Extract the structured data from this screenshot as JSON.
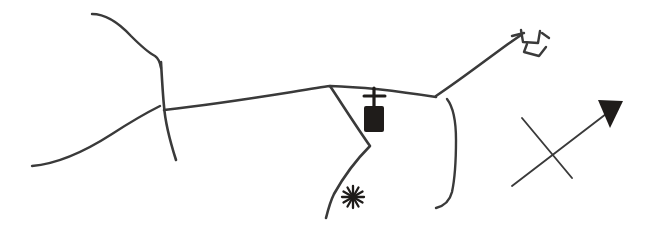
{
  "document": {
    "kind": "hand-drawn sketch map",
    "title": "",
    "background_color": "#ffffff",
    "ink_color": "#3a3a3a",
    "fill_color": "#1f1c1a",
    "width": 647,
    "height": 237
  },
  "map": {
    "roads": [
      {
        "id": "road-north-west-branch",
        "name": "north-west road branch",
        "stroke_width": 2.4,
        "path": "M 92 14 C 104 14, 118 22, 131 36 C 140 45, 147 52, 155 56 C 158 58, 160 62, 161 68"
      },
      {
        "id": "road-vertical-centre-left",
        "name": "centre-left vertical road",
        "stroke_width": 2.6,
        "path": "M 161 62 C 162 80, 163 96, 164 106 C 165 120, 169 138, 176 160"
      },
      {
        "id": "road-south-west-diagonal",
        "name": "south-west diagonal road",
        "stroke_width": 2.4,
        "path": "M 32 166 C 56 164, 84 152, 112 134 C 132 121, 148 112, 160 106"
      },
      {
        "id": "road-main-east-west",
        "name": "main east-west road",
        "stroke_width": 2.6,
        "path": "M 164 110 C 200 106, 248 99, 292 92 C 310 89, 322 87, 330 86 C 366 87, 404 92, 436 97"
      },
      {
        "id": "road-north-east-diagonal",
        "name": "north-east diagonal road to bridge",
        "stroke_width": 2.6,
        "path": "M 436 96 C 460 80, 486 60, 508 44 C 514 40, 518 37, 521 35"
      },
      {
        "id": "road-fork-south-diagonal",
        "name": "southward diagonal road through church fork",
        "stroke_width": 2.6,
        "path": "M 330 86 C 342 104, 356 126, 370 146 C 356 160, 344 176, 334 194 C 330 202, 328 210, 326 218"
      },
      {
        "id": "road-east-loop",
        "name": "eastern loop road",
        "stroke_width": 2.4,
        "path": "M 447 99 C 454 108, 456 122, 456 140 C 456 160, 455 178, 452 192 C 450 200, 444 206, 436 208"
      }
    ],
    "symbols": [
      {
        "id": "church-symbol",
        "name": "church-symbol",
        "label": "church",
        "x": 361,
        "y": 89,
        "body": {
          "x": 364,
          "y": 106,
          "width": 20,
          "height": 26
        },
        "cross_vertical": {
          "x1": 374,
          "y1": 88,
          "x2": 374,
          "y2": 108
        },
        "cross_horizontal": {
          "x1": 364,
          "y1": 96,
          "x2": 385,
          "y2": 96
        }
      },
      {
        "id": "star-symbol",
        "name": "asterisk-star-symbol",
        "label": "star / place of interest",
        "cx": 353,
        "cy": 197,
        "radius": 11,
        "points": 6
      },
      {
        "id": "bridge-symbol",
        "name": "bridge-crossing-symbol",
        "label": "bridge",
        "strokes": [
          "M 512 36 L 524 33",
          "M 521 30 L 523 42 L 538 43 L 540 31",
          "M 527 44 L 524 52 L 539 56 L 546 47",
          "M 542 33 L 549 38"
        ]
      }
    ],
    "north_arrow": {
      "id": "north-arrow",
      "name": "north-arrow",
      "label": "north arrow",
      "shaft": {
        "x1": 512,
        "y1": 186,
        "x2": 606,
        "y2": 114
      },
      "cross_line": {
        "x1": 572,
        "y1": 178,
        "x2": 522,
        "y2": 118
      },
      "head": {
        "points": "598 100, 623 101, 610 128"
      }
    }
  }
}
